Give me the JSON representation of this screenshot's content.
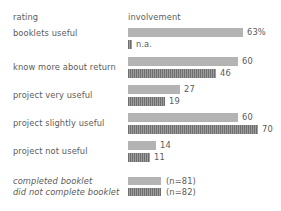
{
  "header": {
    "rating_label": "rating",
    "involvement_label": "involvement"
  },
  "chart_data": {
    "type": "bar",
    "title": "",
    "xlabel": "involvement",
    "ylabel": "rating",
    "orientation": "horizontal",
    "grid": false,
    "legend_position": "bottom",
    "categories": [
      "booklets useful",
      "know more about return",
      "project very useful",
      "project slightly useful",
      "project not useful"
    ],
    "series": [
      {
        "name": "completed booklet",
        "note": "(n=81)",
        "style": "solid",
        "color": "#b3b3b3",
        "values": [
          63,
          60,
          27,
          60,
          14
        ],
        "labels": [
          "63%",
          "60",
          "27",
          "60",
          "14"
        ]
      },
      {
        "name": "did not complete booklet",
        "note": "(n=82)",
        "style": "hatched",
        "color": "#7a7a7a",
        "values": [
          null,
          46,
          19,
          70,
          11
        ],
        "labels": [
          "n.a.",
          "46",
          "19",
          "70",
          "11"
        ]
      }
    ],
    "xlim": [
      0,
      70
    ]
  },
  "rows": [
    {
      "label": "booklets useful",
      "top": 28,
      "label_top": 0,
      "bars": [
        {
          "style": "light",
          "top": 0,
          "width": 115,
          "value": "63%",
          "value_left": 119
        },
        {
          "style": "dark",
          "top": 12,
          "width": 4,
          "value": "n.a.",
          "value_left": 8
        }
      ]
    },
    {
      "label": "know more about return",
      "top": 57,
      "label_top": 5,
      "bars": [
        {
          "style": "light",
          "top": 0,
          "width": 110,
          "value": "60",
          "value_left": 114
        },
        {
          "style": "dark",
          "top": 12,
          "width": 88,
          "value": "46",
          "value_left": 92
        }
      ]
    },
    {
      "label": "project very useful",
      "top": 85,
      "label_top": 5,
      "bars": [
        {
          "style": "light",
          "top": 0,
          "width": 52,
          "value": "27",
          "value_left": 56
        },
        {
          "style": "dark",
          "top": 12,
          "width": 37,
          "value": "19",
          "value_left": 41
        }
      ]
    },
    {
      "label": "project slightly useful",
      "top": 113,
      "label_top": 5,
      "bars": [
        {
          "style": "light",
          "top": 0,
          "width": 110,
          "value": "60",
          "value_left": 114
        },
        {
          "style": "dark",
          "top": 12,
          "width": 130,
          "value": "70",
          "value_left": 134
        }
      ]
    },
    {
      "label": "project not useful",
      "top": 141,
      "label_top": 5,
      "bars": [
        {
          "style": "light",
          "top": 0,
          "width": 28,
          "value": "14",
          "value_left": 32
        },
        {
          "style": "dark",
          "top": 12,
          "width": 22,
          "value": "11",
          "value_left": 26
        }
      ]
    }
  ],
  "legend": {
    "items": [
      {
        "label": "completed booklet",
        "note": "(n=81)",
        "style": "light",
        "top": 0
      },
      {
        "label": "did not complete booklet",
        "note": "(n=82)",
        "style": "dark",
        "top": 11
      }
    ]
  }
}
